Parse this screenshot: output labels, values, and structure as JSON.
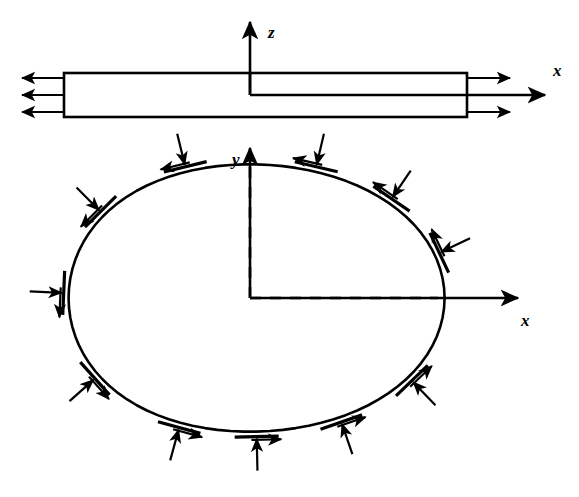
{
  "figure": {
    "background_color": "#ffffff",
    "stroke_color": "#000000",
    "line_width_main": 2.6,
    "line_width_thin": 2.0
  },
  "upper_diagram": {
    "name": "cracked-plate-side-view",
    "plate": {
      "left": 64,
      "right": 467,
      "top": 73,
      "bottom": 117,
      "mid_y": 95
    },
    "crack": {
      "notch_x": 250,
      "notch_top_y": 73,
      "notch_bottom_y": 95,
      "crack_line_y": 95,
      "crack_from_x": 250,
      "crack_to_x": 467
    },
    "z_axis": {
      "label": "z",
      "x": 250,
      "from_y": 95,
      "to_y": 22,
      "label_x": 268,
      "label_y": 24
    },
    "x_axis": {
      "label": "x",
      "y": 95,
      "from_x": 467,
      "to_x": 545,
      "label_x": 553,
      "label_y": 70
    },
    "left_arrows": {
      "count": 3,
      "direction": "left",
      "tail_x": 64,
      "tip_x": 22,
      "ys": [
        78,
        95,
        112
      ]
    },
    "right_arrows": {
      "count": 3,
      "direction": "right",
      "tail_x": 467,
      "tip_x": 510,
      "ys": [
        78,
        95,
        112
      ]
    }
  },
  "lower_diagram": {
    "name": "traction-loaded-contour",
    "oval": {
      "center_x": 250,
      "center_y": 298,
      "radius_x": 188,
      "radius_y": 140
    },
    "origin": {
      "x": 250,
      "y": 298
    },
    "y_axis": {
      "label": "y",
      "x": 250,
      "from_y": 298,
      "to_y": 148,
      "label_x": 232,
      "label_y": 157
    },
    "x_axis": {
      "label": "x",
      "y": 298,
      "from_x": 250,
      "to_x": 518,
      "label_x": 521,
      "label_y": 322
    },
    "dashed_vertical": {
      "x": 250,
      "from_y": 298,
      "to_y": 160
    },
    "dashed_horizontal": {
      "y": 298,
      "from_x": 250,
      "to_x": 438
    },
    "traction_markers": [
      {
        "angle_deg": 70,
        "name": "traction-marker-1"
      },
      {
        "angle_deg": 110,
        "name": "traction-marker-2"
      },
      {
        "angle_deg": 143,
        "name": "traction-marker-3"
      },
      {
        "angle_deg": 178,
        "name": "traction-marker-4"
      },
      {
        "angle_deg": 214,
        "name": "traction-marker-5"
      },
      {
        "angle_deg": 248,
        "name": "traction-marker-6"
      },
      {
        "angle_deg": 272,
        "name": "traction-marker-7"
      },
      {
        "angle_deg": 298,
        "name": "traction-marker-8"
      },
      {
        "angle_deg": 325,
        "name": "traction-marker-9"
      },
      {
        "angle_deg": 18,
        "name": "traction-marker-10"
      },
      {
        "angle_deg": 44,
        "name": "traction-marker-11"
      }
    ],
    "marker_geometry": {
      "tangent_half_length": 22,
      "normal_arrow_length": 34,
      "shear_arrow_length": 30,
      "shear_sense": "counterclockwise",
      "normal_sense": "inward"
    }
  },
  "labels": {
    "z": "z",
    "x_top": "x",
    "y": "y",
    "x_bottom": "x"
  }
}
